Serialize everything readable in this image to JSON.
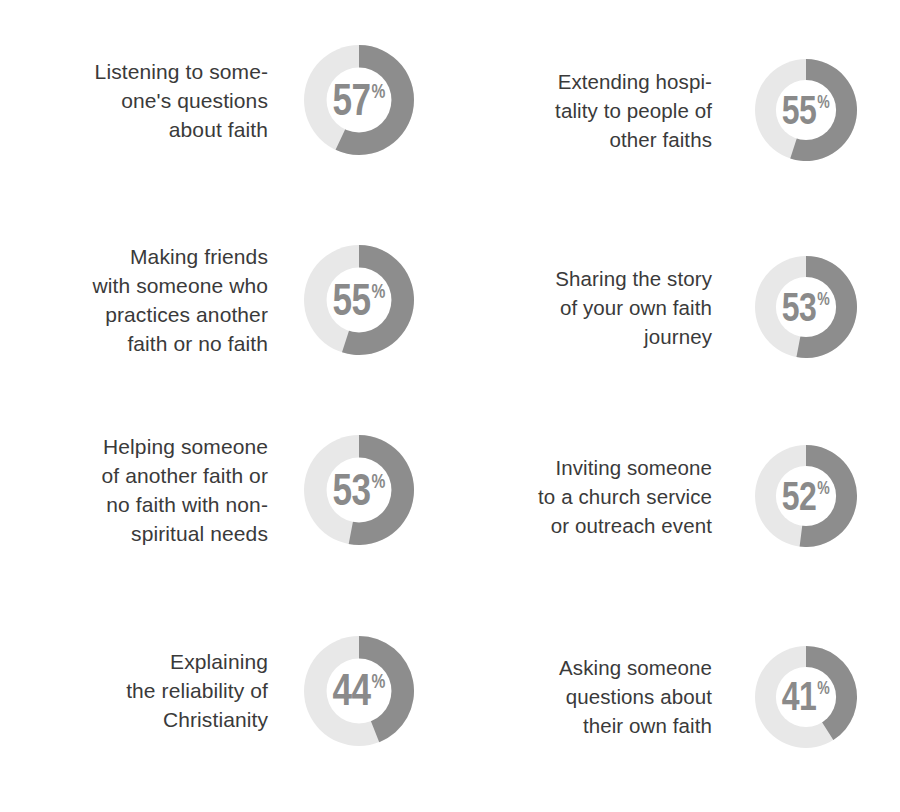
{
  "chart_data": {
    "type": "pie",
    "title": "",
    "subtitle": "",
    "xlabel": "",
    "ylabel": "",
    "legend": [],
    "grid": false,
    "units": "%",
    "value_suffix": "%",
    "colors": {
      "filled_arc": "#8d8d8d",
      "remainder_arc": "#e8e8e8",
      "center_fill": "#ffffff",
      "label_text": "#3a3a3a",
      "value_text": "#8a8a8a",
      "background": "#ffffff"
    },
    "start_angle_deg": 0,
    "direction": "clockwise",
    "categories": [
      "Listening to some-\none's questions\nabout faith",
      "Extending hospi-\ntality to people of\nother faiths",
      "Making friends\nwith someone who\npractices another\nfaith or no faith",
      "Sharing the story\nof your own faith\njourney",
      "Helping someone\nof another faith or\nno faith with non-\nspiritual needs",
      "Inviting someone\nto a church service\nor outreach event",
      "Explaining\nthe reliability of\nChristianity",
      "Asking someone\nquestions about\ntheir own faith"
    ],
    "values": [
      57,
      55,
      55,
      53,
      53,
      52,
      44,
      41
    ]
  },
  "items": [
    {
      "label": "Listening to some-\none's questions\nabout faith",
      "value": 57,
      "value_text": "57",
      "suffix": "%",
      "column": "left",
      "row": 1
    },
    {
      "label": "Extending hospi-\ntality to people of\nother faiths",
      "value": 55,
      "value_text": "55",
      "suffix": "%",
      "column": "right",
      "row": 1
    },
    {
      "label": "Making friends\nwith someone who\npractices another\nfaith or no faith",
      "value": 55,
      "value_text": "55",
      "suffix": "%",
      "column": "left",
      "row": 2
    },
    {
      "label": "Sharing the story\nof your own faith\njourney",
      "value": 53,
      "value_text": "53",
      "suffix": "%",
      "column": "right",
      "row": 2
    },
    {
      "label": "Helping someone\nof another faith or\nno faith with non-\nspiritual needs",
      "value": 53,
      "value_text": "53",
      "suffix": "%",
      "column": "left",
      "row": 3
    },
    {
      "label": "Inviting someone\nto a church service\nor outreach event",
      "value": 52,
      "value_text": "52",
      "suffix": "%",
      "column": "right",
      "row": 3
    },
    {
      "label": "Explaining\nthe reliability of\nChristianity",
      "value": 44,
      "value_text": "44",
      "suffix": "%",
      "column": "left",
      "row": 4
    },
    {
      "label": "Asking someone\nquestions about\ntheir own faith",
      "value": 41,
      "value_text": "41",
      "suffix": "%",
      "column": "right",
      "row": 4
    }
  ]
}
